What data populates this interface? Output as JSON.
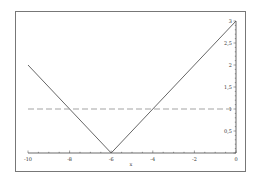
{
  "chart_data": {
    "type": "line",
    "title": "",
    "xlabel": "x",
    "ylabel": "",
    "xlim": [
      -10,
      0
    ],
    "ylim": [
      0,
      3
    ],
    "grid": false,
    "legend": null,
    "x_ticks": [
      -10,
      -8,
      -6,
      -4,
      -2,
      0
    ],
    "x_tick_labels": [
      "-10",
      "-8",
      "-6",
      "-4",
      "-2",
      "0"
    ],
    "y_ticks": [
      0.5,
      1,
      1.5,
      2,
      2.5,
      3
    ],
    "y_tick_labels": [
      "0,5",
      "1",
      "1,5",
      "2",
      "2,5",
      "3"
    ],
    "y_axis_position": "right (at x=0)",
    "series": [
      {
        "name": "|x+6|",
        "style": "solid",
        "color": "#555555",
        "x": [
          -10,
          -6,
          0
        ],
        "y": [
          2,
          0,
          3
        ]
      },
      {
        "name": "y=1",
        "style": "dashed",
        "color": "#999999",
        "x": [
          -10,
          0
        ],
        "y": [
          1,
          1
        ]
      }
    ]
  },
  "axis": {
    "xlabel": "x"
  }
}
